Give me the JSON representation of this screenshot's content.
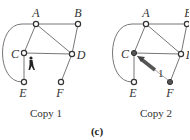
{
  "figure_label": "(c)",
  "copies": [
    {
      "caption": "Copy 1",
      "nodes": {
        "A": "A",
        "B": "B",
        "C": "C",
        "D": "D",
        "E": "E",
        "F": "F"
      },
      "filled_nodes": [],
      "walker_icon": "person-walking-icon",
      "walker_at": "C"
    },
    {
      "caption": "Copy 2",
      "nodes": {
        "A": "A",
        "B": "B",
        "C": "C",
        "D": "D",
        "E": "E",
        "F": "F"
      },
      "filled_nodes": [
        "C",
        "F"
      ],
      "arrow_label": "1",
      "arrow_from": "F",
      "arrow_to": "C"
    }
  ],
  "edges": [
    [
      "A",
      "B"
    ],
    [
      "A",
      "C"
    ],
    [
      "A",
      "D"
    ],
    [
      "B",
      "D"
    ],
    [
      "C",
      "D"
    ],
    [
      "C",
      "E"
    ],
    [
      "D",
      "F"
    ],
    [
      "A",
      "E",
      "arc"
    ]
  ],
  "colors": {
    "edge": "#777777",
    "node_stroke": "#333333",
    "filled": "#555555"
  }
}
